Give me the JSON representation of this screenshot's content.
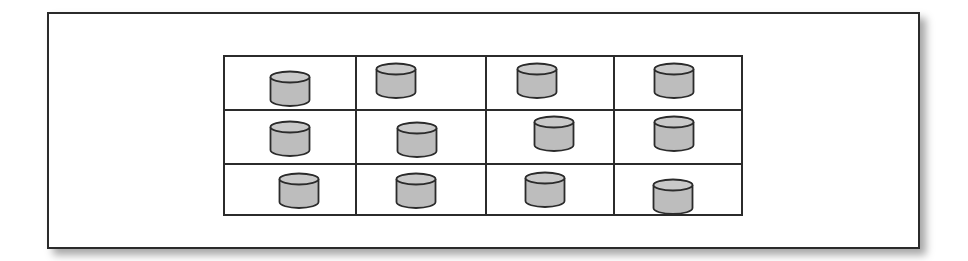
{
  "diagram": {
    "rows": 3,
    "columns": 4,
    "colors": {
      "cylinder_fill": "#bdbdbd",
      "cylinder_top": "#c9c9c9",
      "stroke": "#2b2b2b"
    },
    "grid_lines": {
      "columns_x": [
        130,
        260,
        388
      ],
      "rows_y": [
        52,
        106
      ]
    },
    "cells": [
      {
        "row": 1,
        "col": 1,
        "icon": "database-cylinder-icon",
        "x": 269,
        "y": 70
      },
      {
        "row": 1,
        "col": 2,
        "icon": "database-cylinder-icon",
        "x": 375,
        "y": 62
      },
      {
        "row": 1,
        "col": 3,
        "icon": "database-cylinder-icon",
        "x": 516,
        "y": 62
      },
      {
        "row": 1,
        "col": 4,
        "icon": "database-cylinder-icon",
        "x": 653,
        "y": 62
      },
      {
        "row": 2,
        "col": 1,
        "icon": "database-cylinder-icon",
        "x": 269,
        "y": 120
      },
      {
        "row": 2,
        "col": 2,
        "icon": "database-cylinder-icon",
        "x": 396,
        "y": 121
      },
      {
        "row": 2,
        "col": 3,
        "icon": "database-cylinder-icon",
        "x": 533,
        "y": 115
      },
      {
        "row": 2,
        "col": 4,
        "icon": "database-cylinder-icon",
        "x": 653,
        "y": 115
      },
      {
        "row": 3,
        "col": 1,
        "icon": "database-cylinder-icon",
        "x": 278,
        "y": 172
      },
      {
        "row": 3,
        "col": 2,
        "icon": "database-cylinder-icon",
        "x": 395,
        "y": 172
      },
      {
        "row": 3,
        "col": 3,
        "icon": "database-cylinder-icon",
        "x": 524,
        "y": 171
      },
      {
        "row": 3,
        "col": 4,
        "icon": "database-cylinder-icon",
        "x": 652,
        "y": 178
      }
    ]
  }
}
